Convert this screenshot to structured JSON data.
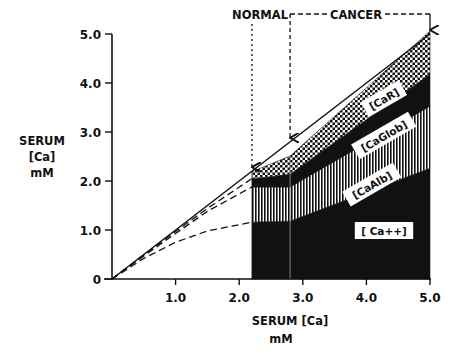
{
  "chart_data": {
    "type": "area",
    "title": "",
    "xlabel": "SERUM [Ca] mM",
    "ylabel": "SERUM [Ca] mM",
    "xlim": [
      0,
      5.0
    ],
    "ylim": [
      0,
      5.0
    ],
    "grid": false,
    "x_ticks": [
      "1.0",
      "2.0",
      "3.0",
      "4.0",
      "5.0"
    ],
    "y_ticks": [
      "0",
      "1.0",
      "2.0",
      "3.0",
      "4.0",
      "5.0"
    ],
    "annotations": {
      "normal": "NORMAL",
      "cancer": "CANCER",
      "normal_arrow_x": 2.2,
      "cancer_arrow_start_x": 2.8,
      "cancer_arrow_end_x": 5.0
    },
    "x": [
      2.2,
      2.8,
      5.0
    ],
    "series": [
      {
        "name": "[Ca++]",
        "pattern": "solid-black",
        "values": [
          1.16,
          1.18,
          2.26
        ]
      },
      {
        "name": "[CaAlb]",
        "pattern": "vertical-stripes",
        "values": [
          0.72,
          0.7,
          1.27
        ]
      },
      {
        "name": "[CaGlob]",
        "pattern": "solid-black",
        "values": [
          0.16,
          0.26,
          0.65
        ]
      },
      {
        "name": "[CaR]",
        "pattern": "checkerboard",
        "values": [
          0.15,
          0.37,
          0.88
        ]
      }
    ],
    "total_line": {
      "name": "total serum Ca (identity)",
      "x": [
        0,
        5.0
      ],
      "y": [
        0,
        5.0
      ],
      "style": "solid"
    },
    "dashed_curves": [
      {
        "name": "Ca++ + CaAlb + CaGlob (normal range)",
        "x": [
          0,
          0.5,
          1.0,
          1.5,
          2.2
        ],
        "y": [
          0,
          0.49,
          0.97,
          1.44,
          2.05
        ]
      },
      {
        "name": "Ca++ + CaAlb (normal range)",
        "x": [
          0,
          0.5,
          1.0,
          1.5,
          2.2
        ],
        "y": [
          0,
          0.47,
          0.93,
          1.38,
          1.88
        ]
      },
      {
        "name": "Ca++ (normal range)",
        "x": [
          0,
          0.5,
          1.0,
          1.5,
          2.2
        ],
        "y": [
          0,
          0.42,
          0.75,
          0.98,
          1.16
        ]
      }
    ],
    "legend": {
      "position": "inline-labels"
    }
  }
}
